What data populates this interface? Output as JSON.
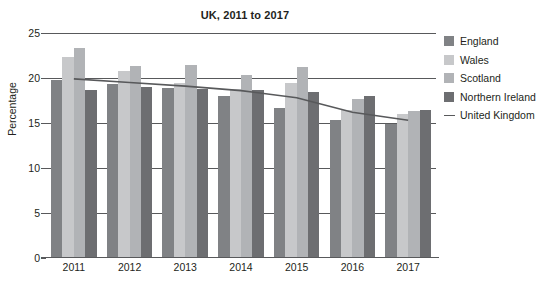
{
  "chart_data": {
    "type": "bar",
    "title": "UK, 2011 to 2017",
    "xlabel": "",
    "ylabel": "Percentage",
    "categories": [
      "2011",
      "2012",
      "2013",
      "2014",
      "2015",
      "2016",
      "2017"
    ],
    "ylim": [
      0,
      25
    ],
    "yticks": [
      0,
      5,
      10,
      15,
      20,
      25
    ],
    "grid": true,
    "legend_position": "right",
    "series": [
      {
        "name": "England",
        "type": "bar",
        "color": "#808285",
        "values": [
          19.8,
          19.3,
          18.9,
          18.0,
          16.7,
          15.3,
          14.9
        ]
      },
      {
        "name": "Wales",
        "type": "bar",
        "color": "#c7c8ca",
        "values": [
          22.3,
          20.8,
          19.5,
          18.8,
          19.5,
          16.4,
          16.0
        ]
      },
      {
        "name": "Scotland",
        "type": "bar",
        "color": "#b1b3b6",
        "values": [
          23.3,
          21.3,
          21.4,
          20.3,
          21.2,
          17.7,
          16.3
        ]
      },
      {
        "name": "Northern Ireland",
        "type": "bar",
        "color": "#6d6e71",
        "values": [
          18.7,
          19.0,
          18.8,
          18.7,
          18.5,
          18.0,
          16.4
        ]
      },
      {
        "name": "United Kingdom",
        "type": "line",
        "color": "#58595b",
        "values": [
          19.9,
          19.5,
          19.1,
          18.6,
          17.8,
          16.2,
          15.3
        ]
      }
    ]
  },
  "legend": {
    "items": [
      {
        "label": "England",
        "color": "#808285",
        "marker": "square"
      },
      {
        "label": "Wales",
        "color": "#c7c8ca",
        "marker": "square"
      },
      {
        "label": "Scotland",
        "color": "#b1b3b6",
        "marker": "square"
      },
      {
        "label": "Northern Ireland",
        "color": "#6d6e71",
        "marker": "square"
      },
      {
        "label": "United Kingdom",
        "color": "#58595b",
        "marker": "line"
      }
    ]
  },
  "footnote": ""
}
